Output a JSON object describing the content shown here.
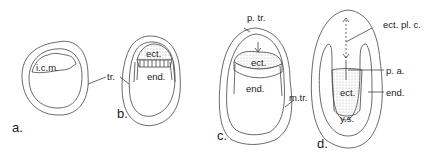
{
  "figure": {
    "panels": [
      {
        "id": "a",
        "label": "a.",
        "structures": [
          "i.c.m.",
          "tr."
        ]
      },
      {
        "id": "b",
        "label": "b.",
        "structures": [
          "ect.",
          "end.",
          "tr."
        ]
      },
      {
        "id": "c",
        "label": "c.",
        "structures": [
          "p. tr.",
          "ect.",
          "end.",
          "m.tr."
        ]
      },
      {
        "id": "d",
        "label": "d.",
        "structures": [
          "ect. pl. c.",
          "p. a.",
          "ect.",
          "end.",
          "y.s."
        ]
      }
    ],
    "labels": {
      "icm": "i.c.m.",
      "tr": "tr.",
      "b_ect": "ect.",
      "b_end": "end.",
      "ptr": "p. tr.",
      "c_ect": "ect.",
      "c_end": "end.",
      "mtr": "m.tr.",
      "ectplc": "ect. pl. c.",
      "pa": "p. a.",
      "d_ect": "ect.",
      "d_end": "end.",
      "ys": "y.s."
    },
    "colors": {
      "line": "#444444",
      "stipple": "#d8d8d8",
      "background": "#ffffff"
    }
  }
}
